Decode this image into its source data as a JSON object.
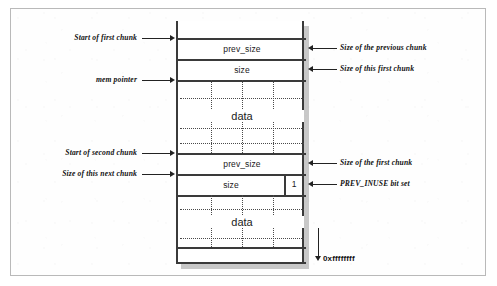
{
  "figure": {
    "colors": {
      "line": "#3a3a3a",
      "text": "#111111",
      "shadow": "#9a9a9a",
      "frame": "#b9b9b9",
      "background": "#ffffff"
    }
  },
  "memory_column": {
    "rows": [
      {
        "id": "top-gap",
        "label": "",
        "kind": "empty"
      },
      {
        "id": "chunk1-prev",
        "label": "prev_size",
        "kind": "field"
      },
      {
        "id": "chunk1-size",
        "label": "size",
        "kind": "field"
      },
      {
        "id": "chunk1-data",
        "label": "data",
        "kind": "data"
      },
      {
        "id": "chunk2-prev",
        "label": "prev_size",
        "kind": "field"
      },
      {
        "id": "chunk2-size",
        "label": "size",
        "kind": "field",
        "flag": "1"
      },
      {
        "id": "chunk2-data",
        "label": "data",
        "kind": "data"
      },
      {
        "id": "bottom-gap",
        "label": "",
        "kind": "empty"
      }
    ],
    "field_labels": {
      "prev_size_first": "prev_size",
      "size_first": "size",
      "data_first": "data",
      "prev_size_second": "prev_size",
      "size_second": "size",
      "prev_inuse_flag": "1",
      "data_second": "data"
    }
  },
  "callouts": {
    "left": [
      {
        "id": "start-first-chunk",
        "text": "Start of first chunk"
      },
      {
        "id": "mem-pointer",
        "text": "mem pointer"
      },
      {
        "id": "start-second-chunk",
        "text": "Start of second chunk"
      },
      {
        "id": "size-next-chunk",
        "text": "Size of this next chunk"
      }
    ],
    "right": [
      {
        "id": "size-previous-chunk",
        "text": "Size of the previous chunk"
      },
      {
        "id": "size-this-first-chunk",
        "text": "Size of this first chunk"
      },
      {
        "id": "size-first-chunk",
        "text": "Size of the first chunk"
      },
      {
        "id": "prev-inuse-bit-set",
        "text": "PREV_INUSE bit set"
      }
    ],
    "address_marker": {
      "id": "high-address",
      "text": "0xffffffff"
    }
  }
}
